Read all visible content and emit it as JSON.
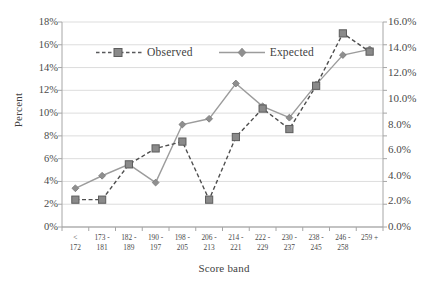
{
  "chart_data": {
    "type": "line",
    "title": "",
    "xlabel": "Score band",
    "ylabel": "Percent",
    "categories": [
      "< 172",
      "173 - 181",
      "182 - 189",
      "190 - 197",
      "198 - 205",
      "206 - 213",
      "214 - 221",
      "222 - 229",
      "230 - 237",
      "238 - 245",
      "246 - 258",
      "259 +"
    ],
    "category_lines": [
      [
        "<",
        "172"
      ],
      [
        "173 -",
        "181"
      ],
      [
        "182 -",
        "189"
      ],
      [
        "190 -",
        "197"
      ],
      [
        "198 -",
        "205"
      ],
      [
        "206 -",
        "213"
      ],
      [
        "214 -",
        "221"
      ],
      [
        "222 -",
        "229"
      ],
      [
        "230 -",
        "237"
      ],
      [
        "238 -",
        "245"
      ],
      [
        "246 -",
        "258"
      ],
      [
        "259 +",
        ""
      ]
    ],
    "series": [
      {
        "name": "Observed",
        "axis": "left",
        "style": "dashed",
        "marker": "square",
        "color": "#58595b",
        "values": [
          2.4,
          2.4,
          5.5,
          6.9,
          7.5,
          2.4,
          7.9,
          10.4,
          8.6,
          12.4,
          17.0,
          15.4
        ]
      },
      {
        "name": "Expected",
        "axis": "right",
        "style": "solid",
        "marker": "diamond",
        "color": "#969696",
        "values_left_scale": [
          3.4,
          4.5,
          5.5,
          3.9,
          9.0,
          9.5,
          12.6,
          10.6,
          9.6,
          12.5,
          15.1,
          15.6
        ],
        "values": [
          3.0,
          4.0,
          4.9,
          3.5,
          8.0,
          8.4,
          11.2,
          9.4,
          8.5,
          11.1,
          13.4,
          13.9
        ]
      }
    ],
    "y_left": {
      "label": "Percent",
      "min": 0,
      "max": 18,
      "step": 2,
      "ticks": [
        "0%",
        "2%",
        "4%",
        "6%",
        "8%",
        "10%",
        "12%",
        "14%",
        "16%",
        "18%"
      ]
    },
    "y_right": {
      "min": 0,
      "max": 16,
      "step": 2,
      "ticks": [
        "0.0%",
        "2.0%",
        "4.0%",
        "6.0%",
        "8.0%",
        "10.0%",
        "12.0%",
        "14.0%",
        "16.0%"
      ]
    },
    "legend": {
      "position": "inside-top-left",
      "entries": [
        {
          "label": "Observed",
          "marker": "square-marker",
          "line": "dashed"
        },
        {
          "label": "Expected",
          "marker": "diamond-marker",
          "line": "solid"
        }
      ]
    },
    "grid": {
      "horizontal": true,
      "vertical": false,
      "color": "#d9d9d9"
    },
    "plot_area": {
      "left": 62,
      "right": 383,
      "top": 22,
      "bottom": 227
    }
  }
}
